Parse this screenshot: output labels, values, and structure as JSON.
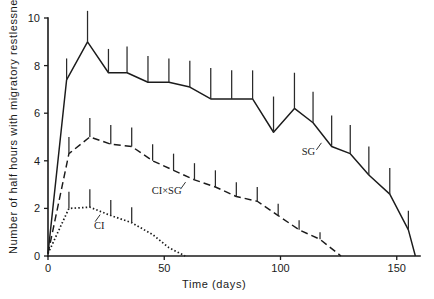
{
  "chart_data": {
    "type": "line",
    "title": "",
    "xlabel": "Time   (days)",
    "ylabel": "Number of half hours with migratory restlessness",
    "xlim": [
      0,
      160
    ],
    "ylim": [
      0,
      10
    ],
    "xticks": [
      0,
      50,
      100,
      150
    ],
    "xticklabels": [
      "0",
      "50",
      "100",
      "150"
    ],
    "yticks": [
      0,
      2,
      4,
      6,
      8,
      10
    ],
    "yticklabels": [
      "0",
      "2",
      "4",
      "6",
      "8",
      "10"
    ],
    "grid": false,
    "legend_position": "inline-annotations",
    "error_bars": "vertical, upper half only (standard error)",
    "annotations": [
      {
        "text": "SG",
        "x": 112,
        "y": 4.25
      },
      {
        "text": "CI×SG",
        "x": 51,
        "y": 2.6
      },
      {
        "text": "CI",
        "x": 22,
        "y": 1.15
      }
    ],
    "series": [
      {
        "name": "SG",
        "style": "solid",
        "label": "SG",
        "x": [
          0,
          8,
          17,
          26,
          34,
          43,
          52,
          61,
          70,
          79,
          88,
          97,
          106,
          114,
          122,
          130,
          138,
          147,
          155,
          158
        ],
        "y": [
          0.1,
          7.4,
          9.0,
          7.7,
          7.7,
          7.3,
          7.3,
          7.1,
          6.6,
          6.6,
          6.6,
          5.2,
          6.2,
          5.6,
          4.6,
          4.3,
          3.4,
          2.6,
          1.1,
          0.0
        ],
        "err": [
          0,
          0.9,
          1.3,
          1.0,
          1.1,
          1.1,
          1.0,
          1.1,
          1.3,
          1.2,
          1.2,
          1.5,
          1.5,
          1.3,
          1.3,
          1.2,
          1.2,
          1.1,
          0.8,
          0
        ]
      },
      {
        "name": "CI×SG",
        "style": "dashed",
        "label": "CI×SG",
        "x": [
          0,
          9,
          18,
          27,
          36,
          45,
          54,
          63,
          72,
          81,
          90,
          99,
          108,
          117,
          126
        ],
        "y": [
          0.1,
          4.3,
          5.0,
          4.7,
          4.6,
          4.0,
          3.6,
          3.2,
          2.9,
          2.5,
          2.3,
          1.7,
          1.1,
          0.7,
          0.0
        ],
        "err": [
          0,
          0.7,
          0.8,
          0.8,
          0.8,
          0.7,
          0.7,
          0.7,
          0.7,
          0.6,
          0.6,
          0.5,
          0.4,
          0.3,
          0
        ]
      },
      {
        "name": "CI",
        "style": "dotted",
        "label": "CI",
        "x": [
          0,
          9,
          18,
          27,
          36,
          45,
          52,
          59
        ],
        "y": [
          0.1,
          2.0,
          2.05,
          1.7,
          1.4,
          0.9,
          0.35,
          0.0
        ],
        "err": [
          0,
          0.7,
          0.75,
          0.65,
          0.65,
          0,
          0,
          0
        ]
      }
    ]
  },
  "axes": {
    "x_title": "Time   (days)",
    "y_title": "Number of half hours with migratory restlessness"
  }
}
